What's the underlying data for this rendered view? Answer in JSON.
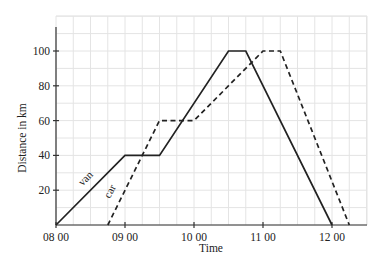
{
  "chart_data": {
    "type": "line",
    "title": "",
    "xlabel": "Time",
    "ylabel": "Distance in km",
    "x_ticks": [
      "08 00",
      "09 00",
      "10 00",
      "11 00",
      "12 00"
    ],
    "x_tick_hours": [
      8,
      9,
      10,
      11,
      12
    ],
    "y_ticks": [
      20,
      40,
      60,
      80,
      100
    ],
    "xlim_hours": [
      8,
      12.5
    ],
    "ylim": [
      0,
      115
    ],
    "grid": true,
    "grid_minor": {
      "x_step_hours": 0.25,
      "y_step": 10
    },
    "legend": "inline labels on lines",
    "series": [
      {
        "name": "van",
        "style": "solid",
        "points": [
          {
            "time": "08:00",
            "hours": 8.0,
            "distance": 0
          },
          {
            "time": "09:00",
            "hours": 9.0,
            "distance": 40
          },
          {
            "time": "09:30",
            "hours": 9.5,
            "distance": 40
          },
          {
            "time": "10:30",
            "hours": 10.5,
            "distance": 100
          },
          {
            "time": "10:45",
            "hours": 10.75,
            "distance": 100
          },
          {
            "time": "12:00",
            "hours": 12.0,
            "distance": 0
          }
        ]
      },
      {
        "name": "car",
        "style": "dashed",
        "points": [
          {
            "time": "08:45",
            "hours": 8.75,
            "distance": 0
          },
          {
            "time": "09:30",
            "hours": 9.5,
            "distance": 60
          },
          {
            "time": "10:00",
            "hours": 10.0,
            "distance": 60
          },
          {
            "time": "11:00",
            "hours": 11.0,
            "distance": 100
          },
          {
            "time": "11:15",
            "hours": 11.25,
            "distance": 100
          },
          {
            "time": "12:15",
            "hours": 12.25,
            "distance": 0
          }
        ]
      }
    ]
  },
  "labels": {
    "xlabel": "Time",
    "ylabel": "Distance in km",
    "van": "van",
    "car": "car"
  },
  "colors": {
    "line": "#222222",
    "grid": "#e4e4e4",
    "axis": "#333333"
  }
}
